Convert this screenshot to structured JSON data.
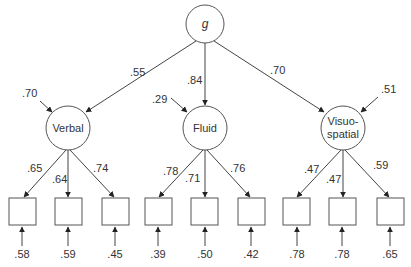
{
  "diagram": {
    "type": "structural-equation-model",
    "general_factor": {
      "label": "g"
    },
    "factors": [
      {
        "label_lines": [
          "Verbal"
        ],
        "loading_from_g": ".55",
        "residual": ".70",
        "indicator_loadings": [
          ".65",
          ".64",
          ".74"
        ],
        "indicator_errors": [
          ".58",
          ".59",
          ".45"
        ]
      },
      {
        "label_lines": [
          "Fluid"
        ],
        "loading_from_g": ".84",
        "residual": ".29",
        "indicator_loadings": [
          ".78",
          ".71",
          ".76"
        ],
        "indicator_errors": [
          ".39",
          ".50",
          ".42"
        ]
      },
      {
        "label_lines": [
          "Visuo-",
          "spatial"
        ],
        "loading_from_g": ".70",
        "residual": ".51",
        "indicator_loadings": [
          ".47",
          ".47",
          ".59"
        ],
        "indicator_errors": [
          ".78",
          ".78",
          ".65"
        ]
      }
    ]
  },
  "colors": {
    "line": "#444444",
    "text": "#333333",
    "background": "#ffffff"
  }
}
